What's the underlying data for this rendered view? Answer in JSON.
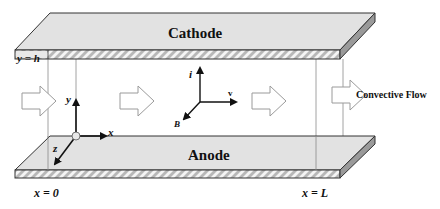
{
  "diagram": {
    "top_plate": {
      "label": "Cathode",
      "boundary_label": "y = h"
    },
    "bottom_plate": {
      "label": "Anode"
    },
    "boundaries": {
      "inlet": "x = 0",
      "outlet": "x = L"
    },
    "axes": {
      "x": "x",
      "y": "y",
      "z": "z"
    },
    "field_vectors": {
      "current": "i",
      "velocity": "v",
      "magnetic": "B"
    },
    "flow": {
      "label": "Convective Flow"
    },
    "colors": {
      "plate_face": "#e2e2e2",
      "plate_side": "#9a9a9a",
      "hatch": "#b5b5b5",
      "outline": "#333333",
      "guide_line": "#8a8a8a"
    }
  }
}
